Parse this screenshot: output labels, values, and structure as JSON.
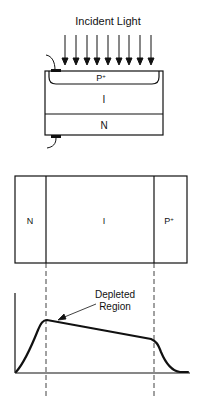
{
  "title": "Incident Light",
  "top_device": {
    "layers": [
      {
        "id": "p_plus",
        "label": "P",
        "sup": "+"
      },
      {
        "id": "intrinsic",
        "label": "I"
      },
      {
        "id": "n",
        "label": "N"
      }
    ],
    "arrow_count": 9
  },
  "cross_section": {
    "regions": [
      {
        "id": "n",
        "label": "N"
      },
      {
        "id": "intrinsic",
        "label": "I"
      },
      {
        "id": "p_plus",
        "label": "P",
        "sup": "+"
      }
    ]
  },
  "graph": {
    "annotation_line1": "Depleted",
    "annotation_line2": "Region"
  },
  "colors": {
    "ink": "#111111",
    "background": "#ffffff"
  }
}
